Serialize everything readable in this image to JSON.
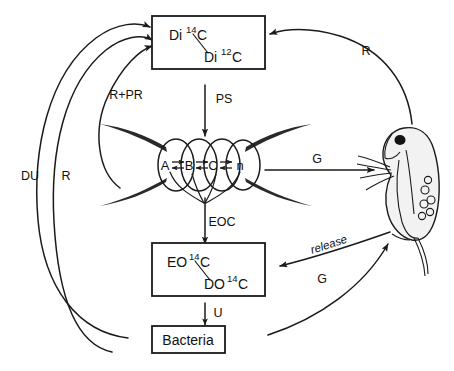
{
  "diagram": {
    "type": "carbon-flow-schematic",
    "background_color": "#ffffff",
    "line_color": "#1a1a1a",
    "nodes": {
      "dissolved_inorganic_carbon": {
        "name": "dissolved-inorganic-carbon-box",
        "numerator_prefix": "Di",
        "numerator_sup": "14",
        "numerator_suffix": "C",
        "denominator_prefix": "Di",
        "denominator_sup": "12",
        "denominator_suffix": "C"
      },
      "extracellular_organic_carbon": {
        "name": "extracellular-organic-carbon-box",
        "numerator_prefix": "EO",
        "numerator_sup": "14",
        "numerator_suffix": "C",
        "denominator_prefix": "DO",
        "denominator_sup": "14",
        "denominator_suffix": "C"
      },
      "bacteria": {
        "name": "bacteria-box",
        "label": "Bacteria"
      },
      "algal_chain": {
        "name": "algal-cell-chain",
        "cells": [
          "A",
          "B",
          "C",
          "n"
        ],
        "equilibrium_symbol": "⇌"
      },
      "zooplankton": {
        "name": "zooplankton-daphnia"
      }
    },
    "flow_labels": {
      "photosynthesis": "PS",
      "respiration_photorespiration": "R+PR",
      "respiration_right": "R",
      "respiration_left": "R",
      "dark_uptake": "DU",
      "extracellular_organic_carbon_release": "EOC",
      "uptake": "U",
      "grazing_algae": "G",
      "grazing_bacteria": "G",
      "release": "release"
    }
  }
}
